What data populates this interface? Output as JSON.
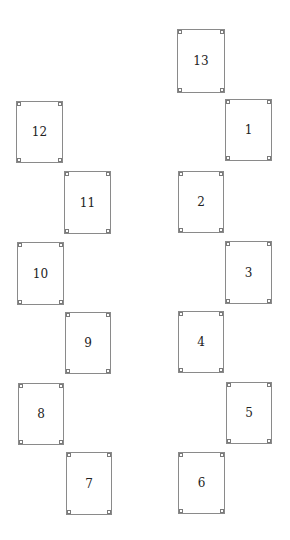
{
  "diagram": {
    "line_color": "#8a8a8a",
    "text_color": "#222222",
    "boxes": [
      {
        "label": "13",
        "x": 177,
        "y": 29
      },
      {
        "label": "12",
        "x": 16,
        "y": 101
      },
      {
        "label": "1",
        "x": 225,
        "y": 99
      },
      {
        "label": "11",
        "x": 64,
        "y": 171
      },
      {
        "label": "2",
        "x": 178,
        "y": 171
      },
      {
        "label": "10",
        "x": 17,
        "y": 242
      },
      {
        "label": "3",
        "x": 225,
        "y": 241
      },
      {
        "label": "9",
        "x": 65,
        "y": 312
      },
      {
        "label": "4",
        "x": 178,
        "y": 311
      },
      {
        "label": "8",
        "x": 18,
        "y": 383
      },
      {
        "label": "5",
        "x": 226,
        "y": 382
      },
      {
        "label": "7",
        "x": 66,
        "y": 452
      },
      {
        "label": "6",
        "x": 178,
        "y": 452
      }
    ]
  }
}
